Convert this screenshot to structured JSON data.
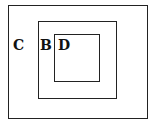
{
  "diagram": {
    "type": "nested-sets",
    "sets": [
      {
        "id": "C",
        "label": "C",
        "contains": [
          "B"
        ]
      },
      {
        "id": "B",
        "label": "B",
        "contains": [
          "D"
        ]
      },
      {
        "id": "D",
        "label": "D",
        "contains": []
      }
    ],
    "colors": {
      "stroke": "#222222",
      "background": "#ffffff"
    }
  }
}
